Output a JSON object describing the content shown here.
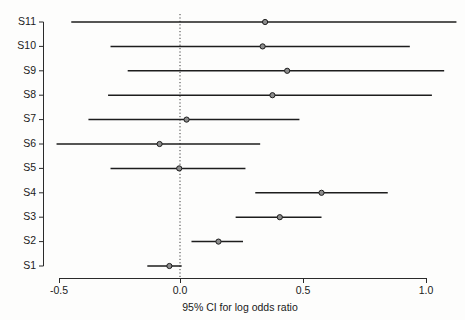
{
  "chart_data": {
    "type": "scatter",
    "subtype": "forest-plot",
    "title": "",
    "xlabel": "95% CI for log odds ratio",
    "ylabel": "",
    "xlim": [
      -0.55,
      1.15
    ],
    "xticks": [
      -0.5,
      0.0,
      0.5,
      1.0
    ],
    "xticklabels": [
      "-0.5",
      "0.0",
      "0.5",
      "1.0"
    ],
    "grid": false,
    "legend": "none",
    "reference_line": 0.0,
    "categories": [
      "S1",
      "S2",
      "S3",
      "S4",
      "S5",
      "S6",
      "S7",
      "S8",
      "S9",
      "S10",
      "S11"
    ],
    "series": [
      {
        "name": "log odds ratio with 95% CI",
        "estimates": [
          -0.05,
          0.15,
          0.4,
          0.57,
          -0.01,
          -0.09,
          0.02,
          0.37,
          0.43,
          0.33,
          0.34
        ],
        "ci_lower": [
          -0.14,
          0.04,
          0.22,
          0.3,
          -0.29,
          -0.51,
          -0.38,
          -0.3,
          -0.22,
          -0.29,
          -0.45
        ],
        "ci_upper": [
          0.0,
          0.25,
          0.57,
          0.84,
          0.26,
          0.32,
          0.48,
          1.02,
          1.07,
          0.93,
          1.12
        ]
      }
    ],
    "rows": [
      {
        "label": "S11",
        "estimate": 0.34,
        "lower": -0.45,
        "upper": 1.12
      },
      {
        "label": "S10",
        "estimate": 0.33,
        "lower": -0.29,
        "upper": 0.93
      },
      {
        "label": "S9",
        "estimate": 0.43,
        "lower": -0.22,
        "upper": 1.07
      },
      {
        "label": "S8",
        "estimate": 0.37,
        "lower": -0.3,
        "upper": 1.02
      },
      {
        "label": "S7",
        "estimate": 0.02,
        "lower": -0.38,
        "upper": 0.48
      },
      {
        "label": "S6",
        "estimate": -0.09,
        "lower": -0.51,
        "upper": 0.32
      },
      {
        "label": "S5",
        "estimate": -0.01,
        "lower": -0.29,
        "upper": 0.26
      },
      {
        "label": "S4",
        "estimate": 0.57,
        "lower": 0.3,
        "upper": 0.84
      },
      {
        "label": "S3",
        "estimate": 0.4,
        "lower": 0.22,
        "upper": 0.57
      },
      {
        "label": "S2",
        "estimate": 0.15,
        "lower": 0.04,
        "upper": 0.25
      },
      {
        "label": "S1",
        "estimate": -0.05,
        "lower": -0.14,
        "upper": 0.0
      }
    ],
    "colors": {
      "line": "#1d1d1d",
      "marker_fill": "#8c8c8c",
      "marker_edge": "#1d1d1d",
      "axis": "#2a2a2a",
      "reference": "#3a3a3a",
      "background": "#fdfdfc",
      "text": "#1a1a1a"
    }
  },
  "axis": {
    "x_title": "95% CI for log odds ratio",
    "x_tick_labels": [
      "-0.5",
      "0.0",
      "0.5",
      "1.0"
    ],
    "y_tick_labels": [
      "S11",
      "S10",
      "S9",
      "S8",
      "S7",
      "S6",
      "S5",
      "S4",
      "S3",
      "S2",
      "S1"
    ]
  }
}
